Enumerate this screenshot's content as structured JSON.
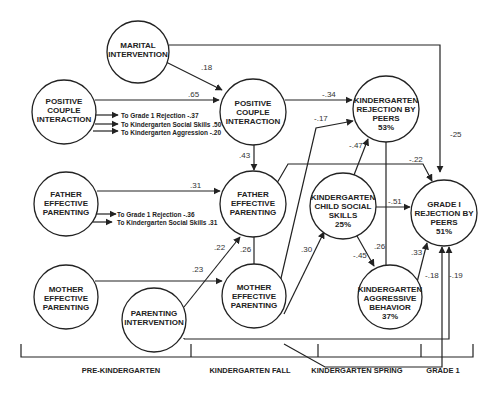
{
  "nodes": {
    "marital_intervention": {
      "lines": [
        "MARITAL",
        "INTERVENTION"
      ]
    },
    "pci_pre": {
      "lines": [
        "POSITIVE",
        "COUPLE",
        "INTERACTION"
      ]
    },
    "pci_k": {
      "lines": [
        "POSITIVE",
        "COUPLE",
        "INTERACTION"
      ]
    },
    "k_rejection": {
      "lines": [
        "KINDERGARTEN",
        "REJECTION BY",
        "PEERS",
        "53%"
      ]
    },
    "fep_pre": {
      "lines": [
        "FATHER",
        "EFFECTIVE",
        "PARENTING"
      ]
    },
    "fep_k": {
      "lines": [
        "FATHER",
        "EFFECTIVE",
        "PARENTING"
      ]
    },
    "k_social": {
      "lines": [
        "KINDERGARTEN",
        "CHILD SOCIAL",
        "SKILLS",
        "25%"
      ]
    },
    "g1_rejection": {
      "lines": [
        "GRADE I",
        "REJECTION BY",
        "PEERS",
        "51%"
      ]
    },
    "mep_pre": {
      "lines": [
        "MOTHER",
        "EFFECTIVE",
        "PARENTING"
      ]
    },
    "parenting_intervention": {
      "lines": [
        "PARENTING",
        "INTERVENTION"
      ]
    },
    "mep_k": {
      "lines": [
        "MOTHER",
        "EFFECTIVE",
        "PARENTING"
      ]
    },
    "k_aggression": {
      "lines": [
        "KINDERGARTEN",
        "AGGRESSIVE",
        "BEHAVIOR",
        "37%"
      ]
    }
  },
  "edges": {
    "marital_to_pci": ".18",
    "marital_to_g1": "-25",
    "pci_pre_to_pci_k": ".65",
    "pci_k_to_krej": "-.34",
    "pci_k_to_fep": ".43",
    "fep_pre_to_fep_k": ".31",
    "fep_k_to_g1": "-.22",
    "fep_k_to_mep": ".26",
    "pi_to_fep": ".22",
    "mep_pre_to_mep_k": ".23",
    "mep_to_krej": "-.17",
    "mep_to_social": ".30",
    "social_to_krej": "-.47",
    "social_to_g1": "-.51",
    "krej_to_agg": ".26",
    "social_to_agg": "-.45",
    "agg_to_g1": ".33",
    "mep_to_g1": "-.18",
    "pi_to_g1": "-.19"
  },
  "notes": {
    "pci_pre": [
      "To Grade 1 Rejection  -.37",
      "To Kindergarten Social Skills  .50",
      "To Kindergarten Aggression  -.20"
    ],
    "fep_pre": [
      "To Grade 1 Rejection -.36",
      "To Kindergarten Social Skills .31"
    ]
  },
  "timeline": [
    "PRE-KINDERGARTEN",
    "KINDERGARTEN FALL",
    "KINDERGARTEN SPRING",
    "GRADE 1"
  ]
}
